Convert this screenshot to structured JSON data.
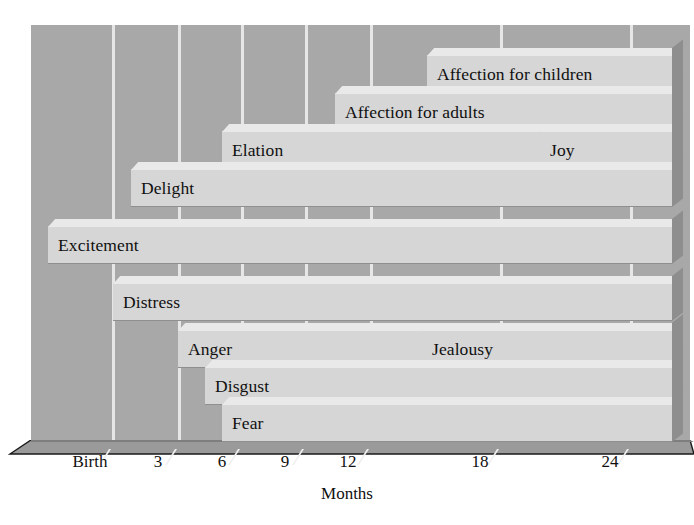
{
  "chart_data": {
    "type": "bar",
    "orientation": "horizontal-timeline",
    "title": "",
    "subtitle": "",
    "xlabel": "Months",
    "ylabel": "",
    "grid": true,
    "legend": "none",
    "xlim": [
      0,
      27
    ],
    "x_ticks": [
      {
        "label": "Birth",
        "value": 0
      },
      {
        "label": "3",
        "value": 3
      },
      {
        "label": "6",
        "value": 6
      },
      {
        "label": "9",
        "value": 9
      },
      {
        "label": "12",
        "value": 12
      },
      {
        "label": "18",
        "value": 18
      },
      {
        "label": "24",
        "value": 24
      }
    ],
    "categories": [
      "Affection for children",
      "Affection for adults",
      "Elation",
      "Joy",
      "Delight",
      "Excitement",
      "Distress",
      "Anger",
      "Jealousy",
      "Disgust",
      "Fear"
    ],
    "series": [
      {
        "name": "Emergence of emotion",
        "points": [
          {
            "label": "Affection for children",
            "start": 15,
            "end": 27
          },
          {
            "label": "Affection for adults",
            "start": 12,
            "end": 27
          },
          {
            "label": "Elation",
            "start": 6,
            "end": 27
          },
          {
            "label": "Joy",
            "start": 18,
            "end": 27
          },
          {
            "label": "Delight",
            "start": 3,
            "end": 27
          },
          {
            "label": "Excitement",
            "start": 0,
            "end": 27
          },
          {
            "label": "Distress",
            "start": 0,
            "end": 27
          },
          {
            "label": "Anger",
            "start": 4,
            "end": 27
          },
          {
            "label": "Jealousy",
            "start": 16,
            "end": 27
          },
          {
            "label": "Disgust",
            "start": 5,
            "end": 27
          },
          {
            "label": "Fear",
            "start": 6,
            "end": 27
          }
        ]
      }
    ]
  },
  "bars": [
    {
      "label": "Affection for children",
      "left": 427,
      "top": 55,
      "width": 245,
      "row": 0
    },
    {
      "label": "Affection for adults",
      "left": 335,
      "top": 93,
      "width": 337,
      "row": 1
    },
    {
      "label": "Elation",
      "left": 222,
      "top": 131,
      "width": 450,
      "row": 2
    },
    {
      "label": "Joy",
      "left": 540,
      "top": 131,
      "width": 132,
      "row": 2.5
    },
    {
      "label": "Delight",
      "left": 131,
      "top": 169,
      "width": 541,
      "row": 3
    },
    {
      "label": "Excitement",
      "left": 48,
      "top": 226,
      "width": 624,
      "row": 4
    },
    {
      "label": "Distress",
      "left": 113,
      "top": 283,
      "width": 559,
      "row": 5
    },
    {
      "label": "Anger",
      "left": 178,
      "top": 330,
      "width": 494,
      "row": 6
    },
    {
      "label": "Jealousy",
      "left": 422,
      "top": 330,
      "width": 250,
      "row": 6.5
    },
    {
      "label": "Disgust",
      "left": 205,
      "top": 367,
      "width": 467,
      "row": 7
    },
    {
      "label": "Fear",
      "left": 222,
      "top": 404,
      "width": 450,
      "row": 8
    }
  ],
  "gridlines_x": [
    112,
    178,
    241,
    305,
    370,
    500,
    630
  ],
  "tick_labels": [
    {
      "text": "Birth",
      "x": 90
    },
    {
      "text": "3",
      "x": 158
    },
    {
      "text": "6",
      "x": 222
    },
    {
      "text": "9",
      "x": 285
    },
    {
      "text": "12",
      "x": 348
    },
    {
      "text": "18",
      "x": 480
    },
    {
      "text": "24",
      "x": 610
    }
  ],
  "axis": {
    "title": "Months"
  },
  "colors": {
    "background": "#ffffff",
    "wall": "#a8a8a8",
    "floor": "#9a9a9a",
    "bar_face": "#d6d6d6",
    "bar_top": "#e9e9e9",
    "bar_side": "#8e8e8e",
    "gridline": "#e6e6e6",
    "text": "#101010"
  }
}
